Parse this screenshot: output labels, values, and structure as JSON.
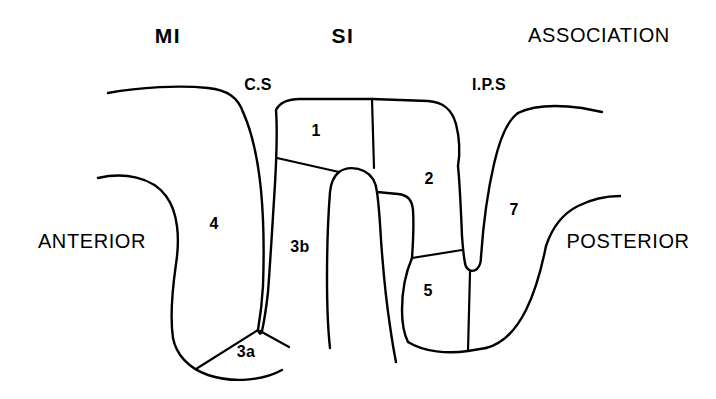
{
  "figure": {
    "background_color": "#ffffff",
    "line_color": "#000000"
  },
  "headings": [
    {
      "name": "mi",
      "text": "MI",
      "x": 168,
      "y": 35
    },
    {
      "name": "si",
      "text": "SI",
      "x": 343,
      "y": 35
    },
    {
      "name": "association",
      "text": "ASSOCIATION",
      "x": 599,
      "y": 35
    }
  ],
  "orientation_labels": [
    {
      "name": "anterior",
      "text": "ANTERIOR",
      "x": 92,
      "y": 241
    },
    {
      "name": "posterior",
      "text": "POSTERIOR",
      "x": 628,
      "y": 241
    }
  ],
  "sulci": [
    {
      "name": "central-sulcus",
      "text": "C.S",
      "x": 258,
      "y": 85
    },
    {
      "name": "intraparietal-sulcus",
      "text": "I.P.S",
      "x": 489,
      "y": 85
    }
  ],
  "cortical_areas": [
    {
      "name": "area-4",
      "text": "4",
      "x": 214,
      "y": 224
    },
    {
      "name": "area-3b",
      "text": "3b",
      "x": 300,
      "y": 247
    },
    {
      "name": "area-3a",
      "text": "3a",
      "x": 246,
      "y": 352
    },
    {
      "name": "area-1",
      "text": "1",
      "x": 316,
      "y": 131
    },
    {
      "name": "area-2",
      "text": "2",
      "x": 429,
      "y": 179
    },
    {
      "name": "area-5",
      "text": "5",
      "x": 428,
      "y": 291
    },
    {
      "name": "area-7",
      "text": "7",
      "x": 514,
      "y": 210
    }
  ]
}
